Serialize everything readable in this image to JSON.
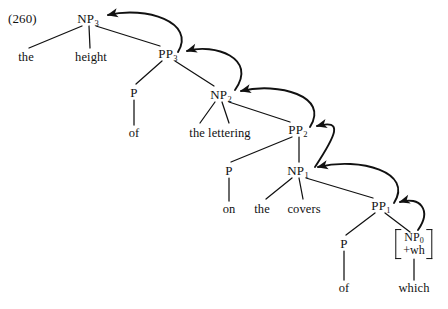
{
  "example": {
    "number": "(260)"
  },
  "sentence": {
    "text": "the height of the lettering on the covers of which"
  },
  "nodes": {
    "np3": {
      "label": "NP",
      "sub": "3",
      "x": 88,
      "y": 18
    },
    "pp3": {
      "label": "PP",
      "sub": "3",
      "x": 168,
      "y": 53
    },
    "np2": {
      "label": "NP",
      "sub": "2",
      "x": 221,
      "y": 94
    },
    "pp2": {
      "label": "PP",
      "sub": "2",
      "x": 298,
      "y": 129
    },
    "np1": {
      "label": "NP",
      "sub": "1",
      "x": 298,
      "y": 170
    },
    "pp1": {
      "label": "PP",
      "sub": "1",
      "x": 381,
      "y": 205
    },
    "p_of1": {
      "label": "P",
      "x": 134,
      "y": 92
    },
    "p_on": {
      "label": "P",
      "x": 229,
      "y": 170
    },
    "p_of2": {
      "label": "P",
      "x": 344,
      "y": 243
    },
    "np0_matrix": {
      "line1": "NP",
      "line1_sub": "0",
      "line2": "+wh",
      "x": 414,
      "y": 244
    }
  },
  "terminals": {
    "the_1": {
      "text": "the",
      "x": 26,
      "y": 57
    },
    "height": {
      "text": "height",
      "x": 91,
      "y": 57
    },
    "of_1": {
      "text": "of",
      "x": 134,
      "y": 133
    },
    "the_lettering": {
      "text": "the lettering",
      "x": 220,
      "y": 133
    },
    "on": {
      "text": "on",
      "x": 229,
      "y": 209
    },
    "the_2": {
      "text": "the",
      "x": 262,
      "y": 209
    },
    "covers": {
      "text": "covers",
      "x": 304,
      "y": 209
    },
    "of_2": {
      "text": "of",
      "x": 344,
      "y": 288
    },
    "which": {
      "text": "which",
      "x": 414,
      "y": 288
    }
  },
  "branches": [
    {
      "name": "np3-to-the",
      "x1": 82,
      "y1": 26,
      "x2": 29,
      "y2": 48
    },
    {
      "name": "np3-to-height",
      "x1": 89,
      "y1": 26,
      "x2": 90,
      "y2": 48
    },
    {
      "name": "np3-to-pp3",
      "x1": 96,
      "y1": 26,
      "x2": 160,
      "y2": 46
    },
    {
      "name": "pp3-to-p",
      "x1": 162,
      "y1": 61,
      "x2": 136,
      "y2": 84
    },
    {
      "name": "pp3-to-np2",
      "x1": 175,
      "y1": 61,
      "x2": 214,
      "y2": 86
    },
    {
      "name": "p-to-of1",
      "x1": 134,
      "y1": 100,
      "x2": 134,
      "y2": 125
    },
    {
      "name": "np2-to-lettering",
      "x1": 215,
      "y1": 102,
      "x2": 200,
      "y2": 123
    },
    {
      "name": "np2-to-lettering2",
      "x1": 222,
      "y1": 102,
      "x2": 229,
      "y2": 123
    },
    {
      "name": "np2-to-pp2",
      "x1": 229,
      "y1": 102,
      "x2": 290,
      "y2": 122
    },
    {
      "name": "pp2-to-p",
      "x1": 292,
      "y1": 137,
      "x2": 231,
      "y2": 162
    },
    {
      "name": "pp2-to-np1",
      "x1": 299,
      "y1": 137,
      "x2": 299,
      "y2": 162
    },
    {
      "name": "p-to-on",
      "x1": 229,
      "y1": 178,
      "x2": 229,
      "y2": 201
    },
    {
      "name": "np1-to-the2",
      "x1": 292,
      "y1": 178,
      "x2": 266,
      "y2": 199
    },
    {
      "name": "np1-to-covers",
      "x1": 299,
      "y1": 178,
      "x2": 303,
      "y2": 199
    },
    {
      "name": "np1-to-pp1",
      "x1": 306,
      "y1": 178,
      "x2": 373,
      "y2": 198
    },
    {
      "name": "pp1-to-p",
      "x1": 375,
      "y1": 213,
      "x2": 346,
      "y2": 235
    },
    {
      "name": "pp1-to-np0",
      "x1": 385,
      "y1": 213,
      "x2": 410,
      "y2": 232
    },
    {
      "name": "p-to-of2",
      "x1": 344,
      "y1": 251,
      "x2": 344,
      "y2": 280
    },
    {
      "name": "np0-to-which",
      "x1": 414,
      "y1": 259,
      "x2": 414,
      "y2": 280
    }
  ],
  "movement_arrows": [
    {
      "name": "arrow-pp3-to-np3",
      "from": "PP3",
      "to": "NP3",
      "path": "M 178,52 C 196,22 146,6 108,15"
    },
    {
      "name": "arrow-np2-to-pp3",
      "from": "NP2",
      "to": "PP3",
      "path": "M 235,90 C 258,58 214,43 187,51"
    },
    {
      "name": "arrow-pp2-to-np2",
      "from": "PP2",
      "to": "NP2",
      "path": "M 310,127 C 330,96 278,82 241,91"
    },
    {
      "name": "arrow-np1-to-pp2",
      "from": "NP1",
      "to": "PP2",
      "path": "M 315,167 C 336,135 344,119 317,126"
    },
    {
      "name": "arrow-pp1-to-np1",
      "from": "PP1",
      "to": "NP1",
      "path": "M 394,203 C 414,172 360,157 318,167"
    },
    {
      "name": "arrow-np0-to-pp1",
      "from": "NP0",
      "to": "PP1",
      "path": "M 418,230 C 432,210 420,196 400,202"
    }
  ],
  "colors": {
    "ink": "#111111",
    "background": "#ffffff"
  }
}
